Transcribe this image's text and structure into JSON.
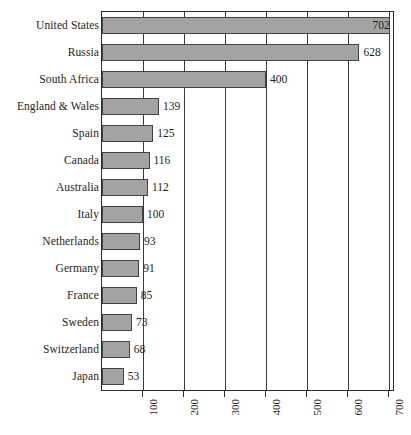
{
  "chart_data": {
    "type": "bar",
    "orientation": "horizontal",
    "title": "",
    "subtitle": "",
    "xlabel": "",
    "ylabel": "",
    "categories": [
      "United States",
      "Russia",
      "South Africa",
      "England & Wales",
      "Spain",
      "Canada",
      "Australia",
      "Italy",
      "Netherlands",
      "Germany",
      "France",
      "Sweden",
      "Switzerland",
      "Japan"
    ],
    "values": [
      702,
      628,
      400,
      139,
      125,
      116,
      112,
      100,
      93,
      91,
      85,
      73,
      68,
      53
    ],
    "value_labels": [
      "702",
      "628",
      "400",
      "139",
      "125",
      "116",
      "112",
      "100",
      "93",
      "91",
      "85",
      "73",
      "68",
      "53"
    ],
    "label_placement": [
      "inside",
      "outside",
      "outside",
      "outside",
      "outside",
      "outside",
      "outside",
      "outside",
      "outside",
      "outside",
      "outside",
      "outside",
      "outside",
      "outside"
    ],
    "xlim": [
      0,
      710
    ],
    "xticks": [
      100,
      200,
      300,
      400,
      500,
      600,
      700
    ],
    "xtick_labels": [
      "100",
      "200",
      "300",
      "400",
      "500",
      "600",
      "700"
    ],
    "xtick_rotation_deg": 90,
    "grid": {
      "vertical": true,
      "horizontal": false
    },
    "legend": {
      "visible": false,
      "position": "none"
    },
    "colors": {
      "bar_fill": "#a3a3a3",
      "bar_edge": "#434343",
      "gridline": "#3a3a3a",
      "axis": "#2b2b2b",
      "text": "#1e1e1e",
      "background": "#ffffff"
    }
  }
}
